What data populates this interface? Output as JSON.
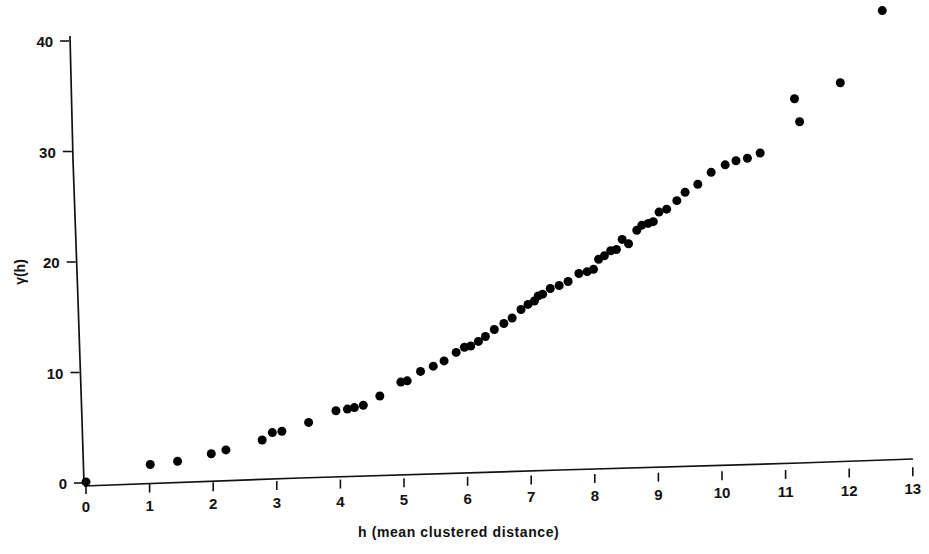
{
  "figure": {
    "background_color": "#ffffff",
    "ink_color": "#111111",
    "marker_color": "#000000"
  },
  "chart_data": {
    "type": "scatter",
    "title": "",
    "subtitle": "",
    "xlabel": "h (mean clustered distance)",
    "ylabel": "γ(h)",
    "xlim": [
      0,
      13.35
    ],
    "ylim": [
      0,
      41.6
    ],
    "xticks": [
      0,
      1,
      2,
      3,
      4,
      5,
      6,
      7,
      8,
      9,
      10,
      11,
      12,
      13
    ],
    "xtick_labels": [
      "0",
      "1",
      "2",
      "3",
      "4",
      "5",
      "6",
      "7",
      "8",
      "9",
      "10",
      "11",
      "12",
      "13"
    ],
    "yticks": [
      0,
      10,
      20,
      30,
      40
    ],
    "ytick_labels": [
      "0",
      "10",
      "20",
      "30",
      "40"
    ],
    "grid": false,
    "legend": null,
    "legend_position": "none",
    "marker": "filled-circle",
    "marker_size_px": 9,
    "n_points": 62,
    "series": [
      {
        "name": "semivariogram",
        "x": [
          0.0,
          1.01,
          1.44,
          1.97,
          2.2,
          2.77,
          2.93,
          3.08,
          3.5,
          3.93,
          4.11,
          4.22,
          4.36,
          4.62,
          4.95,
          5.05,
          5.26,
          5.46,
          5.63,
          5.82,
          5.95,
          6.05,
          6.17,
          6.28,
          6.42,
          6.57,
          6.7,
          6.84,
          6.95,
          7.05,
          7.11,
          7.18,
          7.3,
          7.44,
          7.58,
          7.75,
          7.88,
          7.98,
          8.06,
          8.15,
          8.25,
          8.34,
          8.43,
          8.53,
          8.66,
          8.74,
          8.84,
          8.92,
          9.01,
          9.13,
          9.29,
          9.42,
          9.62,
          9.83,
          10.05,
          10.22,
          10.4,
          10.6,
          11.14,
          11.22,
          11.86,
          12.52
        ],
        "y": [
          0.1,
          1.55,
          1.78,
          2.4,
          2.72,
          3.55,
          4.2,
          4.3,
          5.05,
          6.05,
          6.18,
          6.3,
          6.5,
          7.3,
          8.52,
          8.62,
          9.45,
          9.9,
          10.35,
          11.1,
          11.55,
          11.65,
          12.05,
          12.48,
          13.1,
          13.62,
          14.1,
          14.85,
          15.3,
          15.6,
          16.05,
          16.2,
          16.7,
          16.95,
          17.3,
          18.0,
          18.15,
          18.35,
          19.25,
          19.55,
          20.0,
          20.1,
          21.0,
          20.6,
          21.8,
          22.25,
          22.4,
          22.55,
          23.4,
          23.65,
          24.4,
          25.15,
          25.85,
          26.9,
          27.55,
          27.9,
          28.1,
          28.55,
          33.4,
          31.3,
          34.75,
          41.2
        ]
      }
    ]
  },
  "axes": {
    "x_axis_note": "slightly tilted baseline (scan artifact)",
    "y_axis_note": "slightly tilted vertical axis (scan artifact)"
  }
}
